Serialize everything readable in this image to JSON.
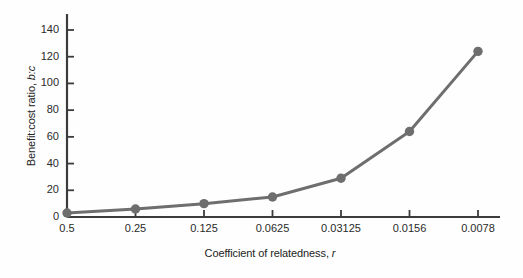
{
  "chart_data": {
    "type": "line",
    "title": "",
    "subtitle": "",
    "xlabel_text": "Coefficient of relatedness, ",
    "xlabel_italic": "r",
    "ylabel_text": "Benefit:cost ratio, ",
    "ylabel_italic": "b:c",
    "categories": [
      "0.5",
      "0.25",
      "0.125",
      "0.0625",
      "0.03125",
      "0.0156",
      "0.0078"
    ],
    "x_numeric": [
      0.5,
      0.25,
      0.125,
      0.0625,
      0.03125,
      0.0156,
      0.0078
    ],
    "values": [
      3,
      6,
      10,
      15,
      29,
      64,
      124
    ],
    "series": [
      {
        "name": "Benefit:cost ratio",
        "values": [
          3,
          6,
          10,
          15,
          29,
          64,
          124
        ]
      }
    ],
    "yticks": [
      0,
      20,
      40,
      60,
      80,
      100,
      120,
      140
    ],
    "ytick_labels": [
      "0",
      "20",
      "40",
      "60",
      "80",
      "100",
      "120",
      "140"
    ],
    "xtick_labels": [
      "0.5",
      "0.25",
      "0.125",
      "0.0625",
      "0.03125",
      "0.0156",
      "0.0078"
    ],
    "ylim": [
      0,
      148
    ],
    "xlim_index": [
      0,
      6
    ],
    "grid": false,
    "legend": "none",
    "line_color": "#6e6e6e",
    "marker_color": "#6e6e6e",
    "axis_color": "#3c3c3c",
    "background_color": "#fefefe",
    "marker": "circle",
    "marker_size": 7,
    "line_width": 3
  }
}
